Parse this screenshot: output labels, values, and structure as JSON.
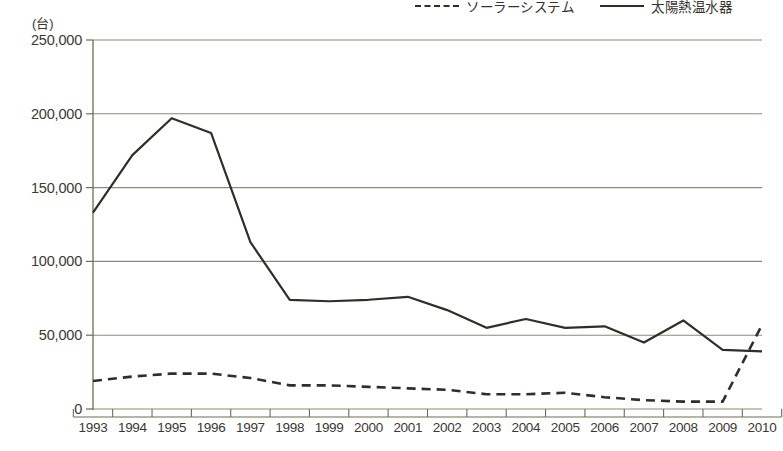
{
  "unit_label": "(台)",
  "legend": {
    "position": "top-right",
    "items": [
      {
        "label": "ソーラーシステム",
        "style": "dashed",
        "color": "#2f2f28",
        "icon": "dashed-line-icon"
      },
      {
        "label": "太陽熱温水器",
        "style": "solid",
        "color": "#2f2f28",
        "icon": "solid-line-icon"
      }
    ]
  },
  "axis": {
    "x_unit": "年",
    "y_ticks": [
      "0",
      "50,000",
      "100,000",
      "150,000",
      "200,000",
      "250,000"
    ],
    "x_ticks": [
      "1993",
      "1994",
      "1995",
      "1996",
      "1997",
      "1998",
      "1999",
      "2000",
      "2001",
      "2002",
      "2003",
      "2004",
      "2005",
      "2006",
      "2007",
      "2008",
      "2009",
      "2010"
    ]
  },
  "colors": {
    "line": "#2f2f28",
    "grid": "#8d8c6e",
    "axis": "#6d6c55",
    "text": "#3a3a32",
    "background": "#ffffff"
  },
  "chart_data": {
    "type": "line",
    "title": "",
    "subtitle": "",
    "xlabel": "年",
    "ylabel": "(台)",
    "ylim": [
      0,
      250000
    ],
    "grid": true,
    "legend_position": "top-right",
    "categories": [
      1993,
      1994,
      1995,
      1996,
      1997,
      1998,
      1999,
      2000,
      2001,
      2002,
      2003,
      2004,
      2005,
      2006,
      2007,
      2008,
      2009,
      2010
    ],
    "series": [
      {
        "name": "太陽熱温水器",
        "style": "solid",
        "values": [
          133000,
          172000,
          197000,
          187000,
          113000,
          74000,
          73000,
          74000,
          76000,
          67000,
          55000,
          61000,
          55000,
          56000,
          45000,
          60000,
          40000,
          39000
        ]
      },
      {
        "name": "ソーラーシステム",
        "style": "dashed",
        "values": [
          19000,
          22000,
          24000,
          24000,
          21000,
          16000,
          16000,
          15000,
          14000,
          13000,
          10000,
          10000,
          11000,
          8000,
          6000,
          5000,
          5000,
          57000
        ]
      }
    ]
  }
}
